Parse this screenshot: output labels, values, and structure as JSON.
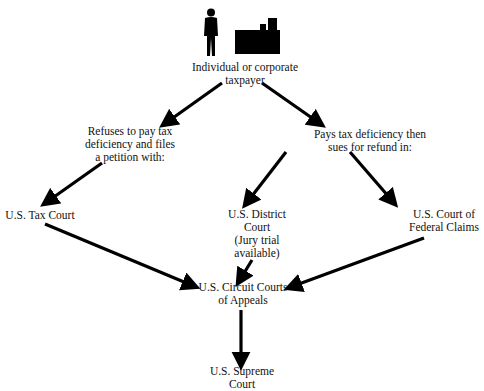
{
  "diagram": {
    "nodes": {
      "taxpayer": {
        "label": "Individual or corporate\ntaxpayer"
      },
      "refuses": {
        "label": "Refuses to pay tax\ndeficiency and files\na petition with:"
      },
      "pays": {
        "label": "Pays tax deficiency then\nsues for refund in:"
      },
      "tax_court": {
        "label": "U.S. Tax Court"
      },
      "district_court": {
        "label": "U.S. District\nCourt\n(Jury trial\navailable)"
      },
      "federal_claims": {
        "label": "U.S. Court of\nFederal Claims"
      },
      "circuit_courts": {
        "label": "U.S. Circuit Courts\nof Appeals"
      },
      "supreme_court": {
        "label": "U.S. Supreme\nCourt"
      }
    },
    "icons": {
      "person": "person-silhouette-icon",
      "building": "factory-building-icon"
    },
    "edges": [
      {
        "from": "taxpayer",
        "to": "refuses"
      },
      {
        "from": "taxpayer",
        "to": "pays"
      },
      {
        "from": "refuses",
        "to": "tax_court"
      },
      {
        "from": "pays",
        "to": "district_court"
      },
      {
        "from": "pays",
        "to": "federal_claims"
      },
      {
        "from": "tax_court",
        "to": "circuit_courts"
      },
      {
        "from": "district_court",
        "to": "circuit_courts"
      },
      {
        "from": "federal_claims",
        "to": "circuit_courts"
      },
      {
        "from": "circuit_courts",
        "to": "supreme_court"
      }
    ],
    "colors": {
      "line": "#000000",
      "text": "#111111",
      "background": "#ffffff"
    }
  }
}
